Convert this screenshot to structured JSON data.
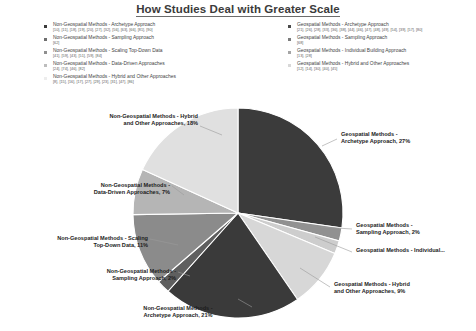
{
  "title": "How Studies Deal with Greater Scale",
  "legend": {
    "left_column": [
      {
        "label": "Non-Geospatial Methods - Archetype Approach",
        "refs": "[10], [11], [18], [19], [20], [27], [32], [56], [63], [66], [81], [90]",
        "color": "#3b3b3b",
        "name": "non-geospatial-archetype"
      },
      {
        "label": "Non-Geospatial Methods - Sampling Approach",
        "refs": "[62]",
        "color": "#6e6e6e",
        "name": "non-geospatial-sampling"
      },
      {
        "label": "Non-Geospatial Methods - Scaling Top-Down Data",
        "refs": "[41], [59], [43], [51], [59], [84]",
        "color": "#8f8f8f",
        "name": "non-geospatial-scaling-top-down"
      },
      {
        "label": "Non-Geospatial Methods - Data-Driven Approaches",
        "refs": "[24], [74], [46], [82]",
        "color": "#bdbdbd",
        "name": "non-geospatial-data-driven"
      },
      {
        "label": "Non-Geospatial Methods - Hybrid and Other Approaches",
        "refs": "[8], [15], [16], [17], [27], [29], [23], [31], [47], [86]",
        "color": "#dedede",
        "name": "non-geospatial-hybrid-other"
      }
    ],
    "right_column": [
      {
        "label": "Geospatial Methods - Archetype Approach",
        "refs": "[21], [26], [28], [33], [36], [38], [44], [46], [47], [48], [49], [54], [39], [57], [80]",
        "color": "#4a4a4a",
        "name": "geospatial-archetype"
      },
      {
        "label": "Geospatial Methods - Sampling Approach",
        "refs": "[68]",
        "color": "#7c7c7c",
        "name": "geospatial-sampling"
      },
      {
        "label": "Geospatial Methods - Individual Building Approach",
        "refs": "[13], [28]",
        "color": "#a5a5a5",
        "name": "geospatial-individual-building"
      },
      {
        "label": "Geospatial Methods - Hybrid and Other Approaches",
        "refs": "[12], [14], [30], [40], [45]",
        "color": "#cfcfcf",
        "name": "geospatial-hybrid-other"
      }
    ]
  },
  "chart_data": {
    "type": "pie",
    "title": "How Studies Deal with Greater Scale",
    "legend_position": "top",
    "grid": false,
    "start_angle_deg": 0,
    "direction": "clockwise",
    "categories": [
      "Geospatial Methods - Archetype Approach",
      "Geospatial Methods - Sampling Approach",
      "Geospatial Methods - Individual Building Approach",
      "Geospatial Methods - Hybrid and Other Approaches",
      "Non-Geospatial Methods - Archetype Approach",
      "Non-Geospatial Methods - Sampling Approach",
      "Non-Geospatial Methods - Scaling Top-Down Data",
      "Non-Geospatial Methods - Data-Driven Approaches",
      "Non-Geospatial Methods - Hybrid and Other Approaches"
    ],
    "values": [
      27,
      2,
      2,
      9,
      21,
      2,
      11,
      7,
      18
    ],
    "colors": [
      "#3b3b3b",
      "#919191",
      "#cdcdcd",
      "#d7d7d7",
      "#3a3a3a",
      "#5f5f5f",
      "#8b8b8b",
      "#b5b5b5",
      "#e0e0e0"
    ],
    "slices": [
      {
        "label": "Geospatial Methods - Archetype Approach",
        "value": 27,
        "color": "#3b3b3b"
      },
      {
        "label": "Geospatial Methods - Sampling Approach",
        "value": 2,
        "color": "#919191"
      },
      {
        "label": "Geospatial Methods - Individual Building Approach",
        "value": 2,
        "color": "#cdcdcd"
      },
      {
        "label": "Geospatial Methods - Hybrid and Other Approaches",
        "value": 9,
        "color": "#d7d7d7"
      },
      {
        "label": "Non-Geospatial Methods - Archetype Approach",
        "value": 21,
        "color": "#3a3a3a"
      },
      {
        "label": "Non-Geospatial Methods - Sampling Approach",
        "value": 2,
        "color": "#5f5f5f"
      },
      {
        "label": "Non-Geospatial Methods - Scaling Top-Down Data",
        "value": 11,
        "color": "#8b8b8b"
      },
      {
        "label": "Non-Geospatial Methods - Data-Driven Approaches",
        "value": 7,
        "color": "#b5b5b5"
      },
      {
        "label": "Non-Geospatial Methods - Hybrid and Other Approaches",
        "value": 18,
        "color": "#e0e0e0"
      }
    ]
  },
  "data_labels": {
    "geospatial_archetype": "Geospatial Methods -\nArchetype Approach, 27%",
    "geospatial_archetype_l1": "Geospatial Methods -",
    "geospatial_archetype_l2": "Archetype Approach, 27%",
    "geospatial_sampling_l1": "Geospatial Methods -",
    "geospatial_sampling_l2": "Sampling Approach, 2%",
    "geospatial_individual": "Geospatial Methods - Individual...",
    "geospatial_hybrid_l1": "Geospatial Methods - Hybrid",
    "geospatial_hybrid_l2": "and Other Approaches, 9%",
    "nongeo_archetype_l1": "Non-Geospatial Methods -",
    "nongeo_archetype_l2": "Archetype Approach, 21%",
    "nongeo_sampling_l1": "Non-Geospatial Methods -",
    "nongeo_sampling_l2": "Sampling Approach, 2%",
    "nongeo_scaling_l1": "Non-Geospatial Methods - Scaling",
    "nongeo_scaling_l2": "Top-Down Data, 11%",
    "nongeo_datadriven_l1": "Non-Geospatial Methods -",
    "nongeo_datadriven_l2": "Data-Driven Approaches, 7%",
    "nongeo_hybrid_l1": "Non-Geospatial Methods - Hybrid",
    "nongeo_hybrid_l2": "and Other Approaches, 18%"
  }
}
